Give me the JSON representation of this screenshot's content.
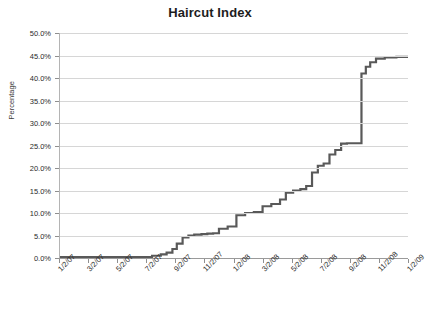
{
  "chart_data": {
    "type": "line",
    "title": "Haircut Index",
    "xlabel": "",
    "ylabel": "Percentage",
    "ylim": [
      0,
      50
    ],
    "ytick_labels": [
      "0.0%",
      "5.0%",
      "10.0%",
      "15.0%",
      "20.0%",
      "25.0%",
      "30.0%",
      "35.0%",
      "40.0%",
      "45.0%",
      "50.0%"
    ],
    "ytick_values": [
      0,
      5,
      10,
      15,
      20,
      25,
      30,
      35,
      40,
      45,
      50
    ],
    "xtick_labels": [
      "1/2/07",
      "3/2/07",
      "5/2/07",
      "7/2/07",
      "9/2/07",
      "11/2/07",
      "1/2/08",
      "3/2/08",
      "5/2/08",
      "7/2/08",
      "9/2/08",
      "11/2/08",
      "1/2/09"
    ],
    "grid": true,
    "legend": false,
    "x_unit": "months_from_jan_2007",
    "x_min_months": 0,
    "x_max_months": 24,
    "series": [
      {
        "name": "Haircut Index",
        "color": "#595959",
        "step_style": "post",
        "x": [
          0,
          1,
          2,
          3,
          4,
          5,
          6,
          6.4,
          7,
          7.4,
          7.8,
          8.1,
          8.5,
          8.9,
          9.3,
          9.8,
          10.2,
          10.6,
          11,
          11.6,
          12.2,
          12.8,
          13.4,
          14,
          14.6,
          15.2,
          15.6,
          16.1,
          16.6,
          17,
          17.4,
          17.8,
          18.2,
          18.6,
          19,
          19.4,
          19.8,
          20.1,
          20.3,
          20.6,
          20.8,
          21.1,
          21.4,
          21.8,
          22.4,
          23.2,
          24
        ],
        "values": [
          0.2,
          0.2,
          0.2,
          0.2,
          0.2,
          0.2,
          0.2,
          0.5,
          0.8,
          1.2,
          2.0,
          3.2,
          4.6,
          5.0,
          5.2,
          5.3,
          5.4,
          5.5,
          6.5,
          7.0,
          9.5,
          10.0,
          10.2,
          11.5,
          12.0,
          13.0,
          14.5,
          15.0,
          15.3,
          16.0,
          19.0,
          20.5,
          21.0,
          23.0,
          24.0,
          25.4,
          25.5,
          25.5,
          25.5,
          25.5,
          41.0,
          42.5,
          43.5,
          44.3,
          44.6,
          44.7,
          44.7
        ]
      }
    ],
    "annotations": [
      {
        "text": "flat near 0% through mid-2007",
        "x_months": 0
      },
      {
        "text": "sharp vertical jump from 25.5% to 41% around 9/2008",
        "x_months": 20.8
      },
      {
        "text": "plateau at about 44.7% through 1/2009",
        "x_months": 23
      }
    ]
  }
}
